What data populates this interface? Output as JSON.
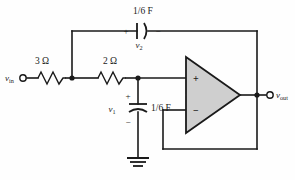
{
  "diagram": {
    "colors": {
      "wire": "#1a1a1a",
      "opamp_fill": "#cfcfcf",
      "background": "#fefefe"
    },
    "components": {
      "resistor_r1": {
        "label": "3 Ω",
        "value": "3",
        "unit": "Ω",
        "name": "3-ohm-resistor"
      },
      "resistor_r2": {
        "label": "2 Ω",
        "value": "2",
        "unit": "Ω",
        "name": "2-ohm-resistor"
      },
      "capacitor_c2": {
        "label": "1/6 F",
        "value": "1/6",
        "unit": "F",
        "voltage_label": "v",
        "voltage_subscript": "2",
        "plus_mark": "+",
        "minus_mark": "−",
        "name": "feedback-capacitor"
      },
      "capacitor_c1": {
        "label": "1/6 F",
        "value": "1/6",
        "unit": "F",
        "voltage_label": "v",
        "voltage_subscript": "1",
        "plus_mark": "+",
        "minus_mark": "−",
        "name": "shunt-capacitor"
      },
      "opamp": {
        "noninverting_pin": "+",
        "inverting_pin": "−",
        "name": "operational-amplifier"
      },
      "ground": {
        "name": "ground-symbol"
      }
    },
    "terminals": {
      "input": {
        "label": "v",
        "subscript": "in",
        "name": "input-terminal"
      },
      "output": {
        "label": "v",
        "subscript": "out",
        "name": "output-terminal"
      }
    }
  }
}
